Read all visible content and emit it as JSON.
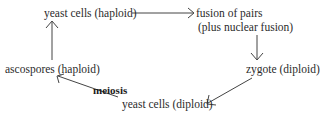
{
  "diagram": {
    "type": "cycle",
    "nodes": {
      "haploid_cells": "yeast cells (haploid)",
      "fusion_line1": "fusion of pairs",
      "fusion_line2": "(plus nuclear fusion)",
      "zygote": "zygote (diploid)",
      "diploid_cells": "yeast cells (diploid)",
      "ascospores": "ascospores (haploid)"
    },
    "edge_labels": {
      "meiosis": "meiosis"
    },
    "edges": [
      {
        "from": "yeast cells (haploid)",
        "to": "fusion of pairs (plus nuclear fusion)"
      },
      {
        "from": "fusion of pairs (plus nuclear fusion)",
        "to": "zygote (diploid)"
      },
      {
        "from": "zygote (diploid)",
        "to": "yeast cells (diploid)"
      },
      {
        "from": "yeast cells (diploid)",
        "to": "ascospores (haploid)",
        "label": "meiosis"
      },
      {
        "from": "ascospores (haploid)",
        "to": "yeast cells (haploid)"
      }
    ]
  }
}
